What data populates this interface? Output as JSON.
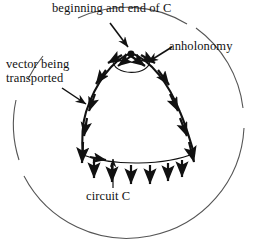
{
  "figure": {
    "title_semantic": "parallel-transport-anholonomy-diagram",
    "colors": {
      "ink": "#111111",
      "outer_circle": "#555555",
      "background": "#ffffff"
    },
    "labels": {
      "beginning_end": "beginning and end of C",
      "anholonomy": "anholonomy",
      "vector_transported_line1": "vector being",
      "vector_transported_line2": "transported",
      "circuit": "circuit C"
    },
    "elements": {
      "outer_circle_name": "great-sphere-outline",
      "apex_point_name": "circuit-start-end-point",
      "anholonomy_arc_name": "anholonomy-angle-arc",
      "left_edge_name": "circuit-left-edge",
      "right_edge_name": "circuit-right-edge",
      "bottom_edge_name": "circuit-bottom-edge"
    },
    "geometry": {
      "outer_circle_center_x": 128,
      "outer_circle_center_y": 123,
      "outer_circle_radius": 116,
      "apex_x": 131,
      "apex_y": 53,
      "bottom_left_x": 83,
      "bottom_left_y": 155,
      "bottom_right_x": 195,
      "bottom_right_y": 153,
      "anholonomy_angle_deg": 62
    },
    "transported_vectors": {
      "count_left_edge": 5,
      "count_right_edge": 5,
      "count_bottom_edge": 7,
      "apex_pair": 2,
      "description": "tangent vector arrows carried around closed circuit C"
    }
  }
}
